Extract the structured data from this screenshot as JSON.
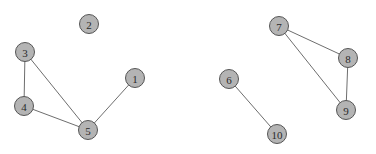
{
  "graph": {
    "directed": false,
    "node_radius": 9.5,
    "colors": {
      "node_fill": "#b4b4b4",
      "node_stroke": "#555555",
      "edge": "#6e6e6e",
      "label": "#2a2a2a",
      "background": "#ffffff"
    },
    "nodes": [
      {
        "id": "1",
        "label": "1",
        "x": 135,
        "y": 78
      },
      {
        "id": "2",
        "label": "2",
        "x": 89,
        "y": 24
      },
      {
        "id": "3",
        "label": "3",
        "x": 25,
        "y": 52
      },
      {
        "id": "4",
        "label": "4",
        "x": 24,
        "y": 106
      },
      {
        "id": "5",
        "label": "5",
        "x": 88,
        "y": 130
      },
      {
        "id": "6",
        "label": "6",
        "x": 229,
        "y": 79
      },
      {
        "id": "7",
        "label": "7",
        "x": 279,
        "y": 26
      },
      {
        "id": "8",
        "label": "8",
        "x": 348,
        "y": 58
      },
      {
        "id": "9",
        "label": "9",
        "x": 346,
        "y": 110
      },
      {
        "id": "10",
        "label": "10",
        "x": 277,
        "y": 134
      }
    ],
    "edges": [
      {
        "source": "3",
        "target": "4"
      },
      {
        "source": "3",
        "target": "5"
      },
      {
        "source": "4",
        "target": "5"
      },
      {
        "source": "1",
        "target": "5"
      },
      {
        "source": "7",
        "target": "8"
      },
      {
        "source": "7",
        "target": "9"
      },
      {
        "source": "8",
        "target": "9"
      },
      {
        "source": "6",
        "target": "10"
      }
    ]
  }
}
